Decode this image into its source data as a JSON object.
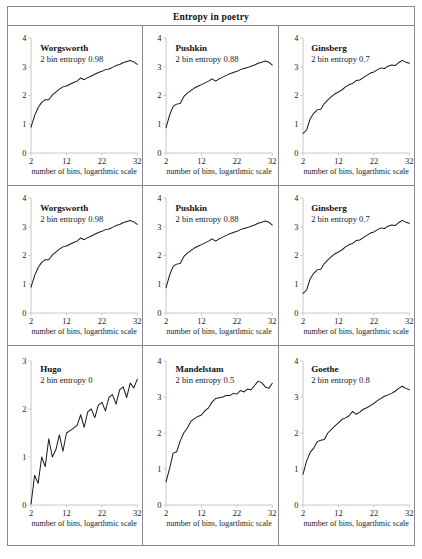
{
  "figure": {
    "title": "Entropy in poetry"
  },
  "axis": {
    "xlabel": "number of bins, logarthmic scale",
    "xticks": [
      "2",
      "12",
      "22",
      "32"
    ],
    "xtick_values": [
      2,
      12,
      22,
      32
    ],
    "xlim": [
      2,
      32
    ]
  },
  "chart_data": {
    "type": "line",
    "title": "Entropy in poetry",
    "xlabel": "number of bins, logarthmic scale",
    "ylabel": "",
    "xlim": [
      2,
      32
    ],
    "grid": false,
    "legend": "none",
    "panel_layout": {
      "rows": 3,
      "cols": 3
    },
    "panels": [
      {
        "poet": "Worgsworth",
        "annotation": "2 bin entropy 0.98",
        "entropy_2bin": 0.98,
        "ylim": [
          0,
          4
        ],
        "yticks": [
          "0",
          "1",
          "2",
          "3",
          "4"
        ],
        "ytick_values": [
          0,
          1,
          2,
          3,
          4
        ],
        "x": [
          2,
          3,
          4,
          5,
          6,
          7,
          8,
          9,
          10,
          11,
          12,
          13,
          14,
          15,
          16,
          17,
          18,
          19,
          20,
          21,
          22,
          23,
          24,
          25,
          26,
          27,
          28,
          29,
          30,
          31,
          32
        ],
        "y": [
          0.9,
          1.3,
          1.58,
          1.76,
          1.85,
          1.85,
          2.02,
          2.12,
          2.22,
          2.3,
          2.33,
          2.39,
          2.45,
          2.5,
          2.61,
          2.55,
          2.62,
          2.68,
          2.74,
          2.8,
          2.84,
          2.9,
          2.92,
          2.98,
          3.04,
          3.08,
          3.14,
          3.18,
          3.22,
          3.17,
          3.08
        ]
      },
      {
        "poet": "Pushkin",
        "annotation": "2 bin entropy 0.88",
        "entropy_2bin": 0.88,
        "ylim": [
          0,
          4
        ],
        "yticks": [
          "0",
          "1",
          "2",
          "3",
          "4"
        ],
        "ytick_values": [
          0,
          1,
          2,
          3,
          4
        ],
        "x": [
          2,
          3,
          4,
          5,
          6,
          7,
          8,
          9,
          10,
          11,
          12,
          13,
          14,
          15,
          16,
          17,
          18,
          19,
          20,
          21,
          22,
          23,
          24,
          25,
          26,
          27,
          28,
          29,
          30,
          31,
          32
        ],
        "y": [
          0.88,
          1.32,
          1.62,
          1.7,
          1.72,
          1.96,
          2.08,
          2.17,
          2.26,
          2.32,
          2.38,
          2.44,
          2.5,
          2.58,
          2.5,
          2.58,
          2.64,
          2.7,
          2.76,
          2.8,
          2.84,
          2.9,
          2.94,
          2.97,
          3.02,
          3.06,
          3.12,
          3.16,
          3.2,
          3.16,
          3.06
        ]
      },
      {
        "poet": "Ginsberg",
        "annotation": "2 bin entropy 0.7",
        "entropy_2bin": 0.7,
        "ylim": [
          0,
          4
        ],
        "yticks": [
          "0",
          "1",
          "2",
          "3",
          "4"
        ],
        "ytick_values": [
          0,
          1,
          2,
          3,
          4
        ],
        "x": [
          2,
          3,
          4,
          5,
          6,
          7,
          8,
          9,
          10,
          11,
          12,
          13,
          14,
          15,
          16,
          17,
          18,
          19,
          20,
          21,
          22,
          23,
          24,
          25,
          26,
          27,
          28,
          29,
          30,
          31,
          32
        ],
        "y": [
          0.68,
          0.8,
          1.18,
          1.38,
          1.5,
          1.52,
          1.72,
          1.85,
          1.96,
          2.06,
          2.12,
          2.2,
          2.3,
          2.38,
          2.42,
          2.52,
          2.54,
          2.62,
          2.7,
          2.78,
          2.82,
          2.9,
          2.96,
          2.94,
          3.02,
          3.06,
          3.04,
          3.14,
          3.22,
          3.16,
          3.12
        ]
      },
      {
        "poet": "Worgsworth",
        "annotation": "2 bin entropy 0.98",
        "entropy_2bin": 0.98,
        "ylim": [
          0,
          4
        ],
        "yticks": [
          "0",
          "1",
          "2",
          "3",
          "4"
        ],
        "ytick_values": [
          0,
          1,
          2,
          3,
          4
        ],
        "x": [
          2,
          3,
          4,
          5,
          6,
          7,
          8,
          9,
          10,
          11,
          12,
          13,
          14,
          15,
          16,
          17,
          18,
          19,
          20,
          21,
          22,
          23,
          24,
          25,
          26,
          27,
          28,
          29,
          30,
          31,
          32
        ],
        "y": [
          0.9,
          1.3,
          1.58,
          1.76,
          1.85,
          1.85,
          2.02,
          2.12,
          2.22,
          2.3,
          2.33,
          2.39,
          2.45,
          2.5,
          2.61,
          2.55,
          2.62,
          2.68,
          2.74,
          2.8,
          2.84,
          2.9,
          2.92,
          2.98,
          3.04,
          3.08,
          3.14,
          3.18,
          3.22,
          3.17,
          3.08
        ]
      },
      {
        "poet": "Pushkin",
        "annotation": "2 bin entropy 0.88",
        "entropy_2bin": 0.88,
        "ylim": [
          0,
          4
        ],
        "yticks": [
          "0",
          "1",
          "2",
          "3",
          "4"
        ],
        "ytick_values": [
          0,
          1,
          2,
          3,
          4
        ],
        "x": [
          2,
          3,
          4,
          5,
          6,
          7,
          8,
          9,
          10,
          11,
          12,
          13,
          14,
          15,
          16,
          17,
          18,
          19,
          20,
          21,
          22,
          23,
          24,
          25,
          26,
          27,
          28,
          29,
          30,
          31,
          32
        ],
        "y": [
          0.88,
          1.32,
          1.62,
          1.7,
          1.72,
          1.96,
          2.08,
          2.17,
          2.26,
          2.32,
          2.38,
          2.44,
          2.5,
          2.58,
          2.5,
          2.58,
          2.64,
          2.7,
          2.76,
          2.8,
          2.84,
          2.9,
          2.94,
          2.97,
          3.02,
          3.06,
          3.12,
          3.16,
          3.2,
          3.16,
          3.06
        ]
      },
      {
        "poet": "Ginsberg",
        "annotation": "2 bin entropy 0.7",
        "entropy_2bin": 0.7,
        "ylim": [
          0,
          4
        ],
        "yticks": [
          "0",
          "1",
          "2",
          "3",
          "4"
        ],
        "ytick_values": [
          0,
          1,
          2,
          3,
          4
        ],
        "x": [
          2,
          3,
          4,
          5,
          6,
          7,
          8,
          9,
          10,
          11,
          12,
          13,
          14,
          15,
          16,
          17,
          18,
          19,
          20,
          21,
          22,
          23,
          24,
          25,
          26,
          27,
          28,
          29,
          30,
          31,
          32
        ],
        "y": [
          0.68,
          0.8,
          1.18,
          1.38,
          1.5,
          1.52,
          1.72,
          1.85,
          1.96,
          2.06,
          2.12,
          2.2,
          2.3,
          2.38,
          2.42,
          2.52,
          2.54,
          2.62,
          2.7,
          2.78,
          2.82,
          2.9,
          2.96,
          2.94,
          3.02,
          3.06,
          3.04,
          3.14,
          3.22,
          3.16,
          3.12
        ]
      },
      {
        "poet": "Hugo",
        "annotation": "2 bin entropy 0",
        "entropy_2bin": 0,
        "ylim": [
          0,
          3
        ],
        "yticks": [
          "0",
          "1",
          "2",
          "3"
        ],
        "ytick_values": [
          0,
          1,
          2,
          3
        ],
        "x": [
          2,
          3,
          4,
          5,
          6,
          7,
          8,
          9,
          10,
          11,
          12,
          13,
          14,
          15,
          16,
          17,
          18,
          19,
          20,
          21,
          22,
          23,
          24,
          25,
          26,
          27,
          28,
          29,
          30,
          31,
          32
        ],
        "y": [
          0.02,
          0.62,
          0.45,
          1.0,
          0.8,
          1.38,
          1.0,
          1.15,
          1.46,
          1.12,
          1.5,
          1.55,
          1.6,
          1.66,
          1.88,
          1.62,
          1.94,
          2.0,
          1.82,
          2.08,
          2.14,
          1.96,
          2.24,
          2.3,
          2.1,
          2.4,
          2.46,
          2.24,
          2.54,
          2.44,
          2.62
        ]
      },
      {
        "poet": "Mandelstam",
        "annotation": "2 bin entropy 0.5",
        "entropy_2bin": 0.5,
        "ylim": [
          0,
          4
        ],
        "yticks": [
          "0",
          "1",
          "2",
          "3",
          "4"
        ],
        "ytick_values": [
          0,
          1,
          2,
          3,
          4
        ],
        "x": [
          2,
          3,
          4,
          5,
          6,
          7,
          8,
          9,
          10,
          11,
          12,
          13,
          14,
          15,
          16,
          17,
          18,
          19,
          20,
          21,
          22,
          23,
          24,
          25,
          26,
          27,
          28,
          29,
          30,
          31,
          32
        ],
        "y": [
          0.64,
          1.02,
          1.44,
          1.48,
          1.78,
          2.0,
          2.14,
          2.32,
          2.4,
          2.46,
          2.5,
          2.62,
          2.7,
          2.86,
          2.96,
          2.98,
          3.0,
          3.04,
          3.04,
          3.1,
          3.08,
          3.18,
          3.14,
          3.22,
          3.2,
          3.32,
          3.44,
          3.4,
          3.28,
          3.24,
          3.38
        ]
      },
      {
        "poet": "Goethe",
        "annotation": "2 bin entropy 0.8",
        "entropy_2bin": 0.8,
        "ylim": [
          0,
          4
        ],
        "yticks": [
          "0",
          "1",
          "2",
          "3",
          "4"
        ],
        "ytick_values": [
          0,
          1,
          2,
          3,
          4
        ],
        "x": [
          2,
          3,
          4,
          5,
          6,
          7,
          8,
          9,
          10,
          11,
          12,
          13,
          14,
          15,
          16,
          17,
          18,
          19,
          20,
          21,
          22,
          23,
          24,
          25,
          26,
          27,
          28,
          29,
          30,
          31,
          32
        ],
        "y": [
          0.86,
          1.22,
          1.46,
          1.58,
          1.76,
          1.8,
          1.82,
          2.0,
          2.1,
          2.2,
          2.28,
          2.38,
          2.42,
          2.48,
          2.6,
          2.52,
          2.58,
          2.66,
          2.7,
          2.76,
          2.82,
          2.9,
          2.96,
          3.02,
          3.06,
          3.1,
          3.16,
          3.24,
          3.3,
          3.24,
          3.2
        ]
      }
    ]
  }
}
